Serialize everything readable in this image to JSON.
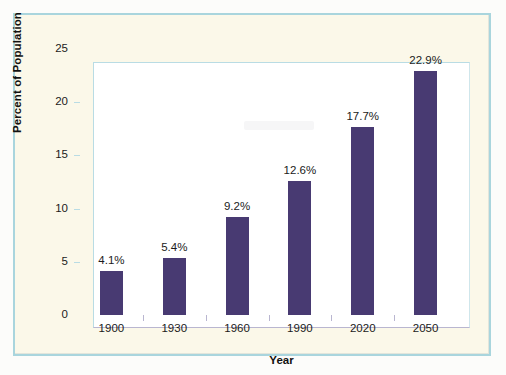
{
  "chart_data": {
    "type": "bar",
    "title": "",
    "xlabel": "Year",
    "ylabel": "Percent of Population",
    "categories": [
      "1900",
      "1930",
      "1960",
      "1990",
      "2020",
      "2050"
    ],
    "values": [
      4.1,
      5.4,
      9.2,
      12.6,
      17.7,
      22.9
    ],
    "value_labels": [
      "4.1%",
      "5.4%",
      "9.2%",
      "12.6%",
      "17.7%",
      "22.9%"
    ],
    "ylim": [
      0,
      25
    ],
    "ytick_labels": [
      "0",
      "5",
      "10",
      "15",
      "20",
      "25"
    ],
    "ytick_values": [
      0,
      5,
      10,
      15,
      20,
      25
    ],
    "grid": false,
    "legend": null,
    "bar_color": "#483a72",
    "plot_background": "#ffffff",
    "figure_background": "#fbf8e9",
    "frame_color": "#a9d5dd",
    "axis_color": "#b9dce4"
  }
}
